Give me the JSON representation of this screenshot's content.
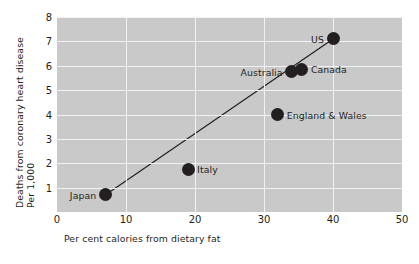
{
  "chart_data": {
    "type": "scatter",
    "title": "",
    "xlabel": "Per cent calories from dietary fat",
    "ylabel_line1": "Deaths from coronary heart disease",
    "ylabel_line2": "Per 1,000",
    "xlim": [
      0,
      50
    ],
    "ylim": [
      0,
      8
    ],
    "xticks": [
      0,
      10,
      20,
      30,
      40,
      50
    ],
    "yticks": [
      1,
      2,
      3,
      4,
      5,
      6,
      7,
      8
    ],
    "grid": true,
    "legend": "none",
    "plot_background": "#c9c9c9",
    "gridline_color": "#f2f2f2",
    "marker_color": "#231f20",
    "points": [
      {
        "label": "Japan",
        "x": 7.0,
        "y": 0.7,
        "label_side": "left"
      },
      {
        "label": "Italy",
        "x": 19.0,
        "y": 1.75,
        "label_side": "right"
      },
      {
        "label": "England & Wales",
        "x": 32.0,
        "y": 4.0,
        "label_side": "right"
      },
      {
        "label": "Australia",
        "x": 34.0,
        "y": 5.75,
        "label_side": "left"
      },
      {
        "label": "Canada",
        "x": 35.5,
        "y": 5.85,
        "label_side": "right"
      },
      {
        "label": "US",
        "x": 40.0,
        "y": 7.1,
        "label_side": "left"
      }
    ],
    "trendline": {
      "x1": 7.0,
      "y1": 0.7,
      "x2": 40.0,
      "y2": 7.1,
      "color": "#231f20"
    }
  }
}
